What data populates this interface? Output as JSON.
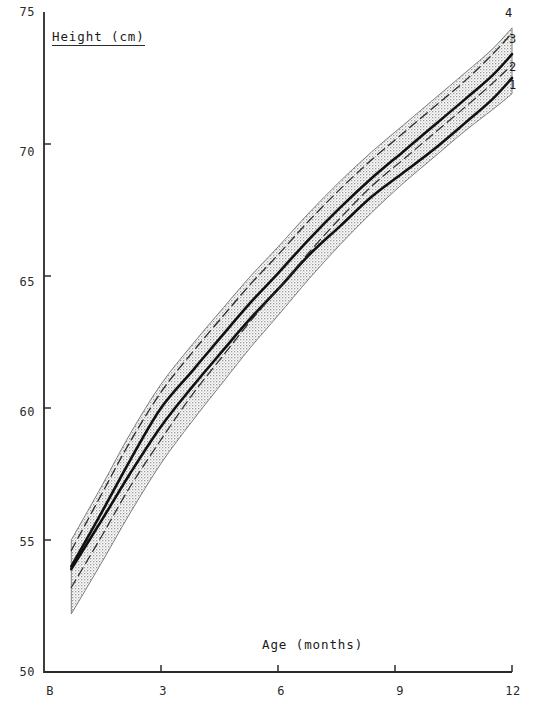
{
  "chart_data": {
    "type": "line",
    "title": "",
    "xlabel": "Age (months)",
    "ylabel": "Height (cm)",
    "xlim": [
      0,
      12
    ],
    "ylim": [
      50,
      75
    ],
    "grid": false,
    "legend_position": "right-inline-end-labels",
    "x_tick_labels": [
      "B",
      "3",
      "6",
      "9",
      "12"
    ],
    "x_tick_values": [
      0,
      3,
      6,
      9,
      12
    ],
    "y_tick_labels": [
      "50",
      "55",
      "60",
      "65",
      "70",
      "75"
    ],
    "y_tick_values": [
      50,
      55,
      60,
      65,
      70,
      75
    ],
    "x": [
      0.7,
      1.5,
      2.2,
      3.0,
      3.8,
      4.6,
      5.3,
      6.0,
      6.8,
      7.6,
      8.4,
      9.2,
      10.0,
      10.8,
      11.5,
      12.0
    ],
    "series": [
      {
        "name": "1",
        "label": "1",
        "style": "solid",
        "width": 2.6,
        "color": "#111111",
        "values": [
          53.9,
          55.8,
          57.5,
          59.3,
          60.8,
          62.2,
          63.4,
          64.5,
          65.8,
          66.9,
          68.0,
          68.9,
          69.8,
          70.8,
          71.7,
          72.5
        ]
      },
      {
        "name": "2",
        "label": "2",
        "style": "dashed",
        "width": 1.2,
        "color": "#2b2b2b",
        "values": [
          53.2,
          55.2,
          57.0,
          58.8,
          60.5,
          62.0,
          63.3,
          64.5,
          65.9,
          67.2,
          68.4,
          69.4,
          70.4,
          71.4,
          72.3,
          73.0
        ]
      },
      {
        "name": "3",
        "label": "3",
        "style": "solid",
        "width": 2.6,
        "color": "#111111",
        "values": [
          54.0,
          56.1,
          58.0,
          60.0,
          61.4,
          62.8,
          64.0,
          65.1,
          66.4,
          67.6,
          68.7,
          69.7,
          70.7,
          71.7,
          72.6,
          73.4
        ]
      },
      {
        "name": "4",
        "label": "4",
        "style": "dashed",
        "width": 1.3,
        "color": "#2b2b2b",
        "values": [
          54.6,
          56.8,
          58.7,
          60.6,
          62.1,
          63.5,
          64.7,
          65.8,
          67.1,
          68.3,
          69.4,
          70.4,
          71.4,
          72.4,
          73.4,
          74.2
        ]
      }
    ],
    "reference_band": {
      "name": "shaded-reference-band",
      "fill": "stipple",
      "fill_color": "#d6d6d6",
      "upper": [
        55.0,
        57.1,
        59.0,
        60.9,
        62.4,
        63.8,
        65.0,
        66.1,
        67.4,
        68.6,
        69.7,
        70.7,
        71.7,
        72.7,
        73.6,
        74.4
      ],
      "lower": [
        52.2,
        54.2,
        56.0,
        57.9,
        59.5,
        61.0,
        62.3,
        63.5,
        64.9,
        66.2,
        67.4,
        68.5,
        69.5,
        70.5,
        71.3,
        71.9
      ]
    },
    "curve_end_labels": [
      {
        "label": "4",
        "x": 12,
        "y": 74.2
      },
      {
        "label": "3",
        "x": 12,
        "y": 73.4
      },
      {
        "label": "2",
        "x": 12,
        "y": 73.0
      },
      {
        "label": "1",
        "x": 12,
        "y": 72.5
      }
    ]
  },
  "axis": {
    "y_title": "Height (cm)",
    "x_title": "Age (months)",
    "y_ticks": [
      {
        "label": "75",
        "top": 5
      },
      {
        "label": "70",
        "top": 145
      },
      {
        "label": "65",
        "top": 275
      },
      {
        "label": "60",
        "top": 405
      },
      {
        "label": "55",
        "top": 535
      },
      {
        "label": "50",
        "top": 665
      }
    ],
    "x_ticks": [
      {
        "label": "B",
        "left": 37
      },
      {
        "label": "3",
        "left": 150
      },
      {
        "label": "6",
        "left": 268
      },
      {
        "label": "9",
        "left": 387
      },
      {
        "label": "12",
        "left": 500
      }
    ]
  },
  "curve_labels": [
    {
      "label": "4",
      "left": 505,
      "top": 6
    },
    {
      "label": "3",
      "left": 509,
      "top": 32
    },
    {
      "label": "2",
      "left": 509,
      "top": 60
    },
    {
      "label": "1",
      "left": 509,
      "top": 78
    }
  ],
  "colors": {
    "ink": "#1a1a1a",
    "axis": "#2b2b2b",
    "band_fill": "#d6d6d6",
    "background": "#ffffff"
  }
}
